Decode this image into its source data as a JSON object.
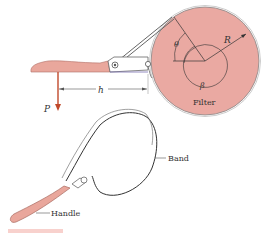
{
  "figure": {
    "labels": {
      "force": "P",
      "distance": "h",
      "angle_theta": "θ",
      "angle_beta": "β",
      "radius": "R",
      "filter": "Filter",
      "band": "Band",
      "handle": "Handle"
    },
    "colors": {
      "filter_fill": "#e8a8a0",
      "handle_fill": "#e9a79c",
      "force_arrow": "#c0492b",
      "line": "#555555",
      "caption": "#e05a4a"
    }
  }
}
